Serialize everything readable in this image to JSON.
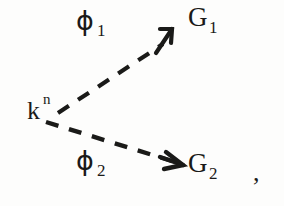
{
  "figure": {
    "type": "physics-diagram",
    "background_color": "#fdfdfc",
    "ink_color": "#1a1a18"
  },
  "labels": {
    "phi1": {
      "symbol": "ϕ",
      "subscript": "1"
    },
    "g1": {
      "symbol": "G",
      "subscript": "1"
    },
    "kn": {
      "symbol": "k",
      "superscript": "n"
    },
    "phi2": {
      "symbol": "ϕ",
      "subscript": "2"
    },
    "g2": {
      "symbol": "G",
      "subscript": "2"
    },
    "comma": ","
  },
  "branches": [
    {
      "name": "upper-branch",
      "from": "k^n",
      "line_label": "ϕ_1",
      "target": "G_1",
      "style": "dashed",
      "direction": "up-right",
      "start": [
        58,
        112
      ],
      "end": [
        168,
        40
      ]
    },
    {
      "name": "lower-branch",
      "from": "k^n",
      "line_label": "ϕ_2",
      "target": "G_2",
      "style": "dashed",
      "direction": "down-right",
      "start": [
        46,
        122
      ],
      "end": [
        176,
        163
      ]
    }
  ]
}
